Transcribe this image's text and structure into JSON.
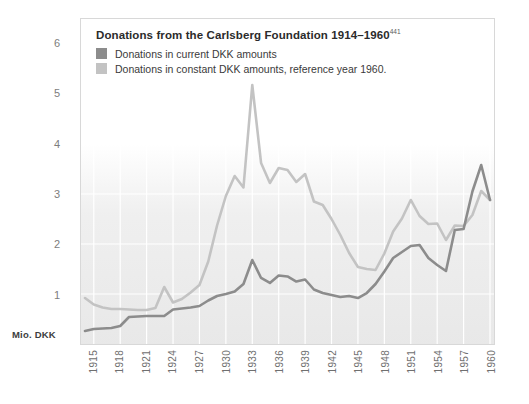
{
  "chart_data": {
    "type": "line",
    "title": "Donations from the Carlsberg Foundation 1914–1960",
    "title_superscript": "441",
    "xlabel": "",
    "ylabel": "Mio. DKK",
    "ylim": [
      0,
      6.5
    ],
    "xlim": [
      1914,
      1960
    ],
    "grid": true,
    "legend_position": "top-left",
    "ytick_labels": [
      "1",
      "2",
      "3",
      "4",
      "5",
      "6"
    ],
    "ytick_values": [
      1,
      2,
      3,
      4,
      5,
      6
    ],
    "xtick_labels": [
      "1915",
      "1918",
      "1921",
      "1924",
      "1927",
      "1930",
      "1933",
      "1936",
      "1939",
      "1942",
      "1945",
      "1948",
      "1951",
      "1954",
      "1957",
      "1960"
    ],
    "xtick_values": [
      1915,
      1918,
      1921,
      1924,
      1927,
      1930,
      1933,
      1936,
      1939,
      1942,
      1945,
      1948,
      1951,
      1954,
      1957,
      1960
    ],
    "x": [
      1914,
      1915,
      1916,
      1917,
      1918,
      1919,
      1920,
      1921,
      1922,
      1923,
      1924,
      1925,
      1926,
      1927,
      1928,
      1929,
      1930,
      1931,
      1932,
      1933,
      1934,
      1935,
      1936,
      1937,
      1938,
      1939,
      1940,
      1941,
      1942,
      1943,
      1944,
      1945,
      1946,
      1947,
      1948,
      1949,
      1950,
      1951,
      1952,
      1953,
      1954,
      1955,
      1956,
      1957,
      1958,
      1959,
      1960
    ],
    "series": [
      {
        "name": "Donations in current DKK amounts",
        "color": "#8c8c8c",
        "values": [
          0.26,
          0.3,
          0.31,
          0.32,
          0.36,
          0.54,
          0.55,
          0.56,
          0.56,
          0.56,
          0.69,
          0.71,
          0.73,
          0.76,
          0.87,
          0.96,
          1.0,
          1.05,
          1.2,
          1.68,
          1.32,
          1.22,
          1.37,
          1.35,
          1.25,
          1.29,
          1.09,
          1.02,
          0.98,
          0.94,
          0.96,
          0.92,
          1.02,
          1.2,
          1.45,
          1.72,
          1.84,
          1.96,
          1.98,
          1.72,
          1.58,
          1.46,
          2.28,
          2.3,
          3.05,
          3.58,
          2.88
        ],
        "units": "Mio. DKK (current)"
      },
      {
        "name": "Donations in constant DKK amounts, reference year 1960.",
        "color": "#c3c3c3",
        "values": [
          0.92,
          0.79,
          0.73,
          0.7,
          0.7,
          0.69,
          0.68,
          0.68,
          0.72,
          1.14,
          0.83,
          0.9,
          1.03,
          1.18,
          1.65,
          2.37,
          2.96,
          3.36,
          3.13,
          5.18,
          3.62,
          3.22,
          3.52,
          3.48,
          3.24,
          3.4,
          2.85,
          2.78,
          2.5,
          2.18,
          1.82,
          1.54,
          1.5,
          1.48,
          1.81,
          2.25,
          2.51,
          2.88,
          2.56,
          2.4,
          2.41,
          2.08,
          2.37,
          2.36,
          2.58,
          3.06,
          2.88
        ],
        "units": "Mio. DKK (constant, 1960)"
      }
    ]
  },
  "legend": {
    "title": "Donations from the Carlsberg Foundation 1914–1960",
    "superscript": "441",
    "items": [
      {
        "label": "Donations in current DKK amounts",
        "color": "#8c8c8c"
      },
      {
        "label": "Donations in constant DKK amounts, reference year 1960.",
        "color": "#c3c3c3"
      }
    ]
  },
  "axes": {
    "unit_label": "Mio. DKK"
  },
  "colors": {
    "current": "#8c8c8c",
    "constant": "#c3c3c3",
    "frame": "#d8d8d8",
    "gridline": "#ffffff",
    "tick_text": "#7d7d7d"
  }
}
